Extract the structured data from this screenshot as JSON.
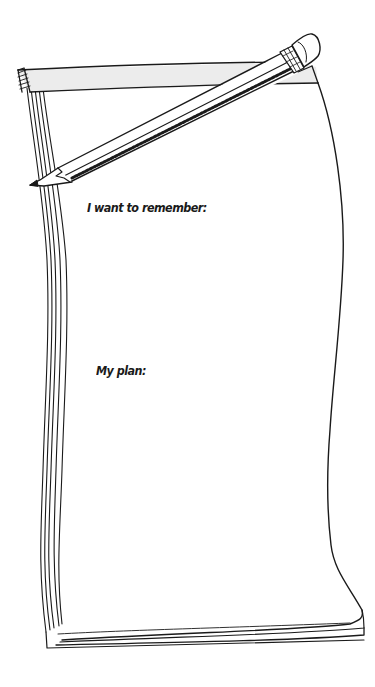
{
  "notepad": {
    "prompts": [
      {
        "label": "I want to remember:"
      },
      {
        "label": "My plan:"
      }
    ]
  },
  "colors": {
    "ink": "#1a1a1a",
    "paper": "#ffffff",
    "binding": "#ececec"
  },
  "icons": {
    "pencil": "pencil-icon",
    "notepad": "notepad-icon"
  }
}
